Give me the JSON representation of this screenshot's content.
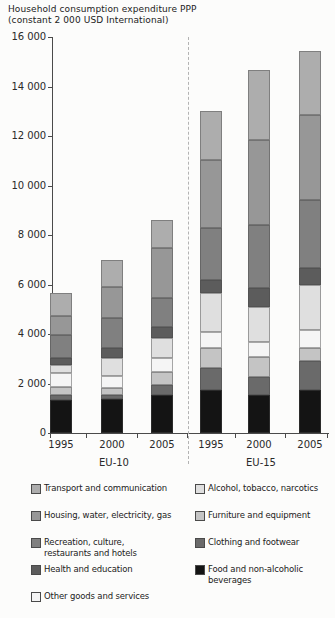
{
  "page_title": "Household consumption expenditure chart",
  "chart_data": {
    "type": "bar",
    "stacked": true,
    "title": "Household consumption expenditure PPP (constant 2 000 USD International)",
    "title_lines": [
      "Household consumption expenditure PPP",
      "(constant 2 000 USD International)"
    ],
    "groups": [
      {
        "label": "EU-10",
        "years": [
          "1995",
          "2000",
          "2005"
        ]
      },
      {
        "label": "EU-15",
        "years": [
          "1995",
          "2000",
          "2005"
        ]
      }
    ],
    "x_labels": [
      "1995",
      "2000",
      "2005",
      "1995",
      "2000",
      "2005"
    ],
    "ylim": [
      0,
      16000
    ],
    "ytick_step": 2000,
    "yticks": [
      "0",
      "2 000",
      "4 000",
      "6 000",
      "8 000",
      "10 000",
      "12 000",
      "14 000",
      "16 000"
    ],
    "grid": false,
    "legend_position": "bottom",
    "series": [
      {
        "name": "Food and non-alcoholic beverages",
        "color": "#141414",
        "values": [
          1330,
          1360,
          1530,
          1730,
          1540,
          1740
        ]
      },
      {
        "name": "Clothing and footwear",
        "color": "#6a6a6a",
        "values": [
          200,
          180,
          400,
          890,
          730,
          1170
        ]
      },
      {
        "name": "Furniture and equipment",
        "color": "#c4c4c4",
        "values": [
          320,
          280,
          530,
          810,
          810,
          530
        ]
      },
      {
        "name": "Other goods and services",
        "color": "#f5f5f5",
        "values": [
          570,
          490,
          570,
          650,
          610,
          730
        ]
      },
      {
        "name": "Alcohol, tobacco, narcotics",
        "color": "#dfdfdf",
        "values": [
          320,
          730,
          810,
          1570,
          1410,
          1820
        ]
      },
      {
        "name": "Health and education",
        "color": "#5c5c5c",
        "values": [
          280,
          400,
          440,
          530,
          770,
          690
        ]
      },
      {
        "name": "Recreation, culture, restaurants and hotels",
        "color": "#808080",
        "values": [
          930,
          1210,
          1190,
          2100,
          2550,
          2750
        ]
      },
      {
        "name": "Housing, water, electricity, gas",
        "color": "#979797",
        "values": [
          770,
          1250,
          2000,
          2750,
          3430,
          3430
        ]
      },
      {
        "name": "Transport and communication",
        "color": "#adadad",
        "values": [
          930,
          1090,
          1130,
          1970,
          2800,
          2570
        ]
      }
    ],
    "totals": [
      5650,
      6990,
      8600,
      13000,
      14650,
      15430
    ],
    "legend_columns": [
      [
        {
          "series": "Transport and communication",
          "label": "Transport and communication"
        },
        {
          "series": "Housing, water, electricity, gas",
          "label": "Housing, water, electricity, gas"
        },
        {
          "series": "Recreation, culture, restaurants and hotels",
          "label": "Recreation, culture,\nrestaurants and hotels"
        },
        {
          "series": "Health and education",
          "label": "Health and education"
        },
        {
          "series": "Other goods and services",
          "label": "Other goods and services"
        }
      ],
      [
        {
          "series": "Alcohol, tobacco, narcotics",
          "label": "Alcohol, tobacco, narcotics"
        },
        {
          "series": "Furniture and equipment",
          "label": "Furniture and equipment"
        },
        {
          "series": "Clothing and footwear",
          "label": "Clothing and footwear"
        },
        {
          "series": "Food and non-alcoholic beverages",
          "label": "Food and non-alcoholic\nbeverages"
        }
      ]
    ]
  }
}
